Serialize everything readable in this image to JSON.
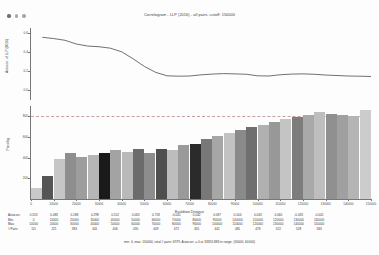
{
  "window": {
    "controls": [
      "window-dot-1",
      "window-dot-2",
      "window-dot-3"
    ]
  },
  "chart_data": {
    "type": "line",
    "title": "Correlogram - LLP (2016) - all pairs, cutoff: 150000",
    "xlabel": "Euclidean Distance",
    "ylabel": "Autocorr. of LLP (2016)",
    "ylim": [
      -0.1,
      0.65
    ],
    "yticks": [
      "0.6",
      "0.4",
      "0.2",
      "0.0"
    ],
    "ytick_values": [
      0.6,
      0.4,
      0.2,
      0.0
    ],
    "reference_line": 0.0,
    "x": [
      5000,
      10000,
      15000,
      20000,
      25000,
      30000,
      35000,
      40000,
      45000,
      50000,
      55000,
      60000,
      65000,
      70000,
      75000,
      80000,
      85000,
      90000,
      95000,
      100000,
      105000,
      110000,
      115000,
      120000,
      125000,
      130000,
      135000,
      140000,
      145000,
      150000
    ],
    "values": [
      0.553,
      0.54,
      0.522,
      0.483,
      0.462,
      0.455,
      0.44,
      0.402,
      0.33,
      0.25,
      0.188,
      0.152,
      0.148,
      0.15,
      0.162,
      0.17,
      0.175,
      0.172,
      0.168,
      0.152,
      0.15,
      0.163,
      0.17,
      0.172,
      0.168,
      0.16,
      0.155,
      0.15,
      0.148,
      0.145
    ],
    "legend": "",
    "grid": false
  },
  "chart_data_bars": {
    "type": "bar",
    "xlabel": "Euclidean Distance",
    "ylabel": "Pairs/lag",
    "ylim": [
      0,
      900
    ],
    "yticks": [
      "800",
      "600",
      "400",
      "200"
    ],
    "ytick_values": [
      800,
      600,
      400,
      200
    ],
    "xticks": [
      "0",
      "10000",
      "20000",
      "30000",
      "40000",
      "50000",
      "60000",
      "70000",
      "80000",
      "90000",
      "100000",
      "110000",
      "120000",
      "130000",
      "140000",
      "150000"
    ],
    "categories": [
      5000,
      10000,
      15000,
      20000,
      25000,
      30000,
      35000,
      40000,
      45000,
      50000,
      55000,
      60000,
      65000,
      70000,
      75000,
      80000,
      85000,
      90000,
      95000,
      100000,
      105000,
      110000,
      115000,
      120000,
      125000,
      130000,
      135000,
      140000,
      145000,
      150000
    ],
    "values": [
      111,
      221,
      383,
      441,
      406,
      430,
      449,
      472,
      455,
      480,
      441,
      481,
      478,
      522,
      528,
      583,
      610,
      640,
      672,
      700,
      718,
      742,
      770,
      795,
      815,
      838,
      824,
      812,
      806,
      862
    ],
    "shades": [
      "#c9c9c9",
      "#555555",
      "#c6c6c6",
      "#8e8e8e",
      "#9d9d9d",
      "#b6b6b6",
      "#1a1a1a",
      "#a3a3a3",
      "#b9b9b9",
      "#6b6b6b",
      "#8d8d8d",
      "#4f4f4f",
      "#bdbdbd",
      "#9a9a9a",
      "#2b2b2b",
      "#787878",
      "#a6a6a6",
      "#c2c2c2",
      "#8a8a8a",
      "#6f6f6f",
      "#b0b0b0",
      "#989898",
      "#c4c4c4",
      "#7d7d7d",
      "#a9a9a9",
      "#bebebe",
      "#909090",
      "#a0a0a0",
      "#b4b4b4",
      "#cccccc"
    ]
  },
  "stats_table": {
    "row_labels": [
      "Autocorr.",
      "Min.",
      "Max.",
      "# Pairs"
    ],
    "columns": [
      {
        "autocorr": "0.553",
        "min": "0",
        "max": "10000",
        "pairs": "111"
      },
      {
        "autocorr": "0.483",
        "min": "10000",
        "max": "20000",
        "pairs": "221"
      },
      {
        "autocorr": "0.188",
        "min": "20000",
        "max": "30000",
        "pairs": "383"
      },
      {
        "autocorr": "0.298",
        "min": "30000",
        "max": "40000",
        "pairs": "441"
      },
      {
        "autocorr": "0.152",
        "min": "40000",
        "max": "50000",
        "pairs": "406"
      },
      {
        "autocorr": "0.063",
        "min": "50000",
        "max": "60000",
        "pairs": "430"
      },
      {
        "autocorr": "0.718",
        "min": "60000",
        "max": "70000",
        "pairs": "449"
      },
      {
        "autocorr": "-0.041",
        "min": "70000",
        "max": "80000",
        "pairs": "472"
      },
      {
        "autocorr": "0.042",
        "min": "80000",
        "max": "90000",
        "pairs": "455"
      },
      {
        "autocorr": "0.087",
        "min": "90000",
        "max": "100000",
        "pairs": "441"
      },
      {
        "autocorr": "0.004",
        "min": "100000",
        "max": "110000",
        "pairs": "481"
      },
      {
        "autocorr": "0.043",
        "min": "110000",
        "max": "120000",
        "pairs": "478"
      },
      {
        "autocorr": "0.060",
        "min": "120000",
        "max": "130000",
        "pairs": "522"
      },
      {
        "autocorr": "-0.033",
        "min": "130000",
        "max": "140000",
        "pairs": "528"
      },
      {
        "autocorr": "-0.041",
        "min": "140000",
        "max": "150000",
        "pairs": "583"
      }
    ]
  },
  "footer": {
    "text": "min: 0, max: 150000, total # pairs: 6979, Autocorr. = 0 at 33353.883 in range: (50000, 60000)"
  }
}
